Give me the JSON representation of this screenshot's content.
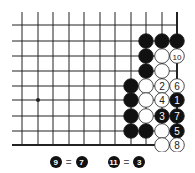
{
  "diagram": {
    "type": "go-board-fragment",
    "grid": {
      "columns_x": [
        22,
        38,
        53,
        69,
        84,
        100,
        115,
        131,
        146,
        162,
        177
      ],
      "rows_y": [
        25,
        41,
        56,
        71,
        86,
        100,
        116,
        131,
        145
      ],
      "line_left_x": 12,
      "line_top_y": 12,
      "thick_edges": [
        "bottom",
        "right"
      ],
      "star_point": {
        "col": 1,
        "row": 5
      }
    },
    "colors": {
      "line": "#222222",
      "black_stone": "#111111",
      "white_stone": "#ffffff",
      "stone_outline": "#222222"
    },
    "stones": [
      {
        "col": 8,
        "row": 1,
        "color": "black",
        "label": ""
      },
      {
        "col": 9,
        "row": 1,
        "color": "black",
        "label": ""
      },
      {
        "col": 10,
        "row": 1,
        "color": "black",
        "label": ""
      },
      {
        "col": 8,
        "row": 2,
        "color": "black",
        "label": ""
      },
      {
        "col": 9,
        "row": 2,
        "color": "white",
        "label": ""
      },
      {
        "col": 10,
        "row": 2,
        "color": "white",
        "label": "10"
      },
      {
        "col": 8,
        "row": 3,
        "color": "black",
        "label": ""
      },
      {
        "col": 9,
        "row": 3,
        "color": "white",
        "label": ""
      },
      {
        "col": 7,
        "row": 4,
        "color": "black",
        "label": ""
      },
      {
        "col": 8,
        "row": 4,
        "color": "white",
        "label": ""
      },
      {
        "col": 9,
        "row": 4,
        "color": "white",
        "label": "2"
      },
      {
        "col": 10,
        "row": 4,
        "color": "white",
        "label": "6"
      },
      {
        "col": 7,
        "row": 5,
        "color": "black",
        "label": ""
      },
      {
        "col": 8,
        "row": 5,
        "color": "white",
        "label": ""
      },
      {
        "col": 9,
        "row": 5,
        "color": "white",
        "label": "4"
      },
      {
        "col": 10,
        "row": 5,
        "color": "black",
        "label": "1"
      },
      {
        "col": 7,
        "row": 6,
        "color": "black",
        "label": ""
      },
      {
        "col": 8,
        "row": 6,
        "color": "white",
        "label": ""
      },
      {
        "col": 9,
        "row": 6,
        "color": "black",
        "label": "3"
      },
      {
        "col": 10,
        "row": 6,
        "color": "black",
        "label": "7"
      },
      {
        "col": 7,
        "row": 7,
        "color": "black",
        "label": ""
      },
      {
        "col": 8,
        "row": 7,
        "color": "black",
        "label": ""
      },
      {
        "col": 9,
        "row": 7,
        "color": "white",
        "label": ""
      },
      {
        "col": 10,
        "row": 7,
        "color": "black",
        "label": "5"
      },
      {
        "col": 9,
        "row": 8,
        "color": "white",
        "label": ""
      },
      {
        "col": 10,
        "row": 8,
        "color": "white",
        "label": "8"
      }
    ]
  },
  "caption": {
    "items": [
      {
        "move": "9",
        "eq": "=",
        "at": "7"
      },
      {
        "move": "11",
        "eq": "=",
        "at": "3"
      }
    ]
  }
}
